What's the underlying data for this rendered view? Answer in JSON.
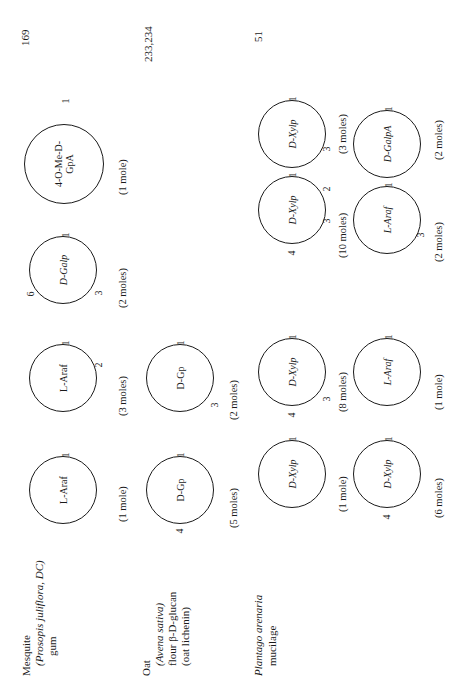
{
  "entries": [
    {
      "source_lines": [
        "Mesquite",
        "(Prosopis juliflora, DC)",
        "gum"
      ],
      "reference": "169",
      "units": [
        {
          "label": "L-Araf",
          "moles": "(1 mole)",
          "positions": [
            "1"
          ]
        },
        {
          "label": "L-Araf",
          "moles": "(3 moles)",
          "positions": [
            "1",
            "2"
          ]
        },
        {
          "label": "D-Galp",
          "moles": "(2 moles)",
          "positions": [
            "6",
            "1",
            "3"
          ]
        },
        {
          "label_line1": "4-O-Me-D-",
          "label_line2": "GpA",
          "moles": "(1 mole)",
          "positions": [
            "1"
          ]
        }
      ]
    },
    {
      "source_lines": [
        "Oat",
        "(Avena sativa)",
        "flour β-D-glucan",
        "(oat lichenin)"
      ],
      "reference": "233,234",
      "units": [
        {
          "label": "D-Gp",
          "moles": "(5 moles)",
          "positions": [
            "4",
            "1"
          ]
        },
        {
          "label": "D-Gp",
          "moles": "(2 moles)",
          "positions": [
            "1",
            "3"
          ]
        }
      ]
    },
    {
      "source_lines": [
        "Plantago arenaria",
        "mucilage"
      ],
      "reference": "51",
      "units_row_a": [
        {
          "label": "D-Xylp",
          "moles": "(1 mole)",
          "positions": [
            "1"
          ]
        },
        {
          "label": "D-Xylp",
          "moles": "(8 moles)",
          "positions": [
            "4",
            "1",
            "3"
          ]
        },
        {
          "label": "D-Xylp",
          "moles": "(10 moles)",
          "positions": [
            "4",
            "1",
            "2",
            "3"
          ]
        },
        {
          "label": "D-Xylp",
          "moles": "(3 moles)",
          "positions": [
            "1",
            "3"
          ]
        }
      ],
      "units_row_b": [
        {
          "label": "D-Xylp",
          "moles": "(6 moles)",
          "positions": [
            "4",
            "1"
          ]
        },
        {
          "label": "L-Araf",
          "moles": "(1 mole)",
          "positions": [
            "1"
          ]
        },
        {
          "label": "L-Araf",
          "moles": "(2 moles)",
          "positions": [
            "1",
            "3"
          ]
        },
        {
          "label": "D-GalpA",
          "moles": "(2 moles)",
          "positions": [
            "1"
          ]
        }
      ]
    }
  ]
}
